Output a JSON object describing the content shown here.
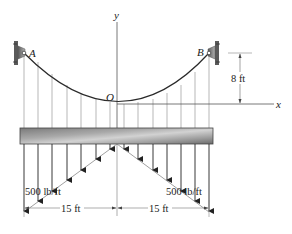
{
  "figure": {
    "type": "statics-cable-diagram",
    "labels": {
      "support_left": "A",
      "support_right": "B",
      "origin": "O",
      "x_axis": "x",
      "y_axis": "y",
      "sag_dimension": "8 ft",
      "load_left": "500 lb/ft",
      "load_right": "500 lb/ft",
      "span_left": "15 ft",
      "span_right": "15 ft"
    },
    "geometry": {
      "cable_sag_ft": 8,
      "half_span_ft": 15,
      "max_distributed_load_lb_per_ft": 500,
      "load_distribution": "triangular, zero at center, maximum 500 lb/ft at each end",
      "hanger_count": 15
    },
    "colors": {
      "line": "#333333",
      "thin_line": "#888888",
      "beam_dark": "#6e6e6e",
      "beam_light": "#c8c8c8",
      "support": "#8a8a8a"
    }
  }
}
